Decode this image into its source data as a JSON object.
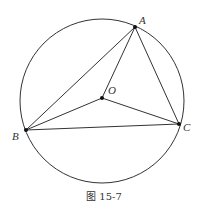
{
  "figure": {
    "caption": "图 15-7",
    "stroke_color": "#333333",
    "circle": {
      "cx": 102,
      "cy": 101,
      "r": 82
    },
    "points": {
      "A": {
        "label": "A",
        "x": 135,
        "y": 27
      },
      "O": {
        "label": "O",
        "x": 102,
        "y": 98
      },
      "B": {
        "label": "B",
        "x": 26,
        "y": 130
      },
      "C": {
        "label": "C",
        "x": 179,
        "y": 124
      }
    },
    "segments": [
      "AB",
      "AC",
      "BC",
      "OA",
      "OB",
      "OC"
    ]
  }
}
